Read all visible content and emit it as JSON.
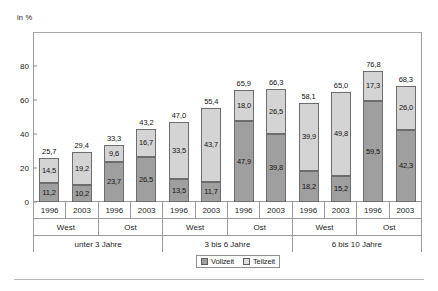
{
  "axis": {
    "unit_label": "in %",
    "y_ticks": [
      "0",
      "20",
      "40",
      "60",
      "80"
    ],
    "y_min": 0,
    "y_max": 90
  },
  "legend": {
    "items": [
      {
        "label": "Vollzeit",
        "swatch": "vollzeit-swatch",
        "color": "#9f9f9f"
      },
      {
        "label": "Teilzeit",
        "swatch": "teilzeit-swatch",
        "color": "#dedede"
      }
    ]
  },
  "categories": {
    "years": [
      "1996",
      "2003",
      "1996",
      "2003",
      "1996",
      "2003",
      "1996",
      "2003",
      "1996",
      "2003",
      "1996",
      "2003"
    ],
    "regions": [
      "West",
      "Ost",
      "West",
      "Ost",
      "West",
      "Ost"
    ],
    "age_groups": [
      "unter 3 Jahre",
      "3 bis 6 Jahre",
      "6 bis 10 Jahre"
    ]
  },
  "chart_data": {
    "type": "bar",
    "title": "",
    "subtitle": "",
    "xlabel": "",
    "ylabel": "in %",
    "ylim": [
      0,
      90
    ],
    "grid": false,
    "stacked": true,
    "legend_position": "bottom",
    "categories": [
      "unter 3 Jahre / West / 1996",
      "unter 3 Jahre / West / 2003",
      "unter 3 Jahre / Ost / 1996",
      "unter 3 Jahre / Ost / 2003",
      "3 bis 6 Jahre / West / 1996",
      "3 bis 6 Jahre / West / 2003",
      "3 bis 6 Jahre / Ost / 1996",
      "3 bis 6 Jahre / Ost / 2003",
      "6 bis 10 Jahre / West / 1996",
      "6 bis 10 Jahre / West / 2003",
      "6 bis 10 Jahre / Ost / 1996",
      "6 bis 10 Jahre / Ost / 2003"
    ],
    "series": [
      {
        "name": "Vollzeit",
        "color": "#9f9f9f",
        "values": [
          11.2,
          10.2,
          23.7,
          26.5,
          13.5,
          11.7,
          47.9,
          39.8,
          18.2,
          15.2,
          59.5,
          42.3
        ],
        "labels": [
          "11,2",
          "10,2",
          "23,7",
          "26,5",
          "13,5",
          "11,7",
          "47,9",
          "39,8",
          "18,2",
          "15,2",
          "59,5",
          "42,3"
        ]
      },
      {
        "name": "Teilzeit",
        "color": "#d4d4d4",
        "values": [
          14.5,
          19.2,
          9.6,
          16.7,
          33.5,
          43.7,
          18.0,
          26.5,
          39.9,
          49.8,
          17.3,
          26.0
        ],
        "labels": [
          "14,5",
          "19,2",
          "9,6",
          "16,7",
          "33,5",
          "43,7",
          "18,0",
          "26,5",
          "39,9",
          "49,8",
          "17,3",
          "26,0"
        ]
      }
    ],
    "totals": [
      25.7,
      29.4,
      33.3,
      43.2,
      47.0,
      55.4,
      65.9,
      66.3,
      58.1,
      65.0,
      76.8,
      68.3
    ],
    "total_labels": [
      "25,7",
      "29,4",
      "33,3",
      "43,2",
      "47,0",
      "55,4",
      "65,9",
      "66,3",
      "58,1",
      "65,0",
      "76,8",
      "68,3"
    ]
  }
}
